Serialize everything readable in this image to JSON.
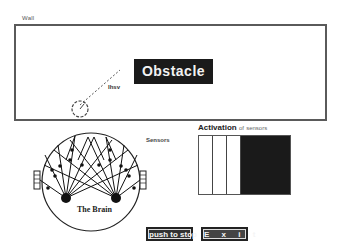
{
  "world": {
    "wall_label": "Wall",
    "obstacle_label": "Obstacle",
    "sensor_ray_label": "Ihsv"
  },
  "robot": {
    "sensors_label": "Sensors",
    "brain_label": "The Brain"
  },
  "activation": {
    "title_main": "Activation",
    "title_of": "of",
    "title_sensors": "sensors",
    "columns": [
      {
        "name": "sensor-1",
        "state": "inactive",
        "color": "#ffffff",
        "width": 14
      },
      {
        "name": "sensor-2",
        "state": "inactive",
        "color": "#ffffff",
        "width": 14
      },
      {
        "name": "sensor-3",
        "state": "inactive",
        "color": "#ffffff",
        "width": 14
      },
      {
        "name": "sensor-4",
        "state": "active",
        "color": "#1a1a1a",
        "width": 49
      }
    ]
  },
  "buttons": {
    "stop_label": "push to stop",
    "exit_label": "E x i t"
  },
  "colors": {
    "obstacle_bg": "#1a1a1a",
    "wall_border": "#5a5a5a",
    "active_sensor": "#1a1a1a",
    "button_bg": "#222222"
  }
}
